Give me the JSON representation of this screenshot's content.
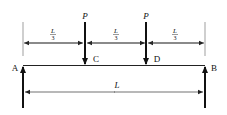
{
  "diagram": {
    "type": "simply-supported-beam",
    "beam": {
      "left_end": "A",
      "right_end": "B"
    },
    "loads": [
      {
        "label": "P",
        "point": "C",
        "position": "L/3"
      },
      {
        "label": "P",
        "point": "D",
        "position": "2L/3"
      }
    ],
    "supports": [
      {
        "label": "A",
        "reaction": "upward"
      },
      {
        "label": "B",
        "reaction": "upward"
      }
    ],
    "dimensions": {
      "segments": [
        {
          "numerator": "L",
          "denominator": "3"
        },
        {
          "numerator": "L",
          "denominator": "3"
        },
        {
          "numerator": "L",
          "denominator": "3"
        }
      ],
      "total": "L"
    },
    "point_labels": {
      "A": "A",
      "B": "B",
      "C": "C",
      "D": "D"
    },
    "colors": {
      "line": "#111111",
      "thin": "#333333",
      "background": "#ffffff"
    }
  }
}
